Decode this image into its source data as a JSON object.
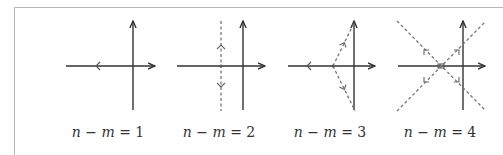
{
  "figure": {
    "panels": [
      {
        "id": "p1",
        "label": {
          "lhs_n": "n",
          "minus": " − ",
          "lhs_m": "m",
          "eq": " = ",
          "value": "1"
        },
        "origin": [
          133,
          66
        ],
        "centroid": [
          133,
          66
        ],
        "asymptote_count": 1,
        "asymptote_angles_deg": [
          180
        ],
        "asymptotes": "single asymptote along negative real axis"
      },
      {
        "id": "p2",
        "label": {
          "lhs_n": "n",
          "minus": " − ",
          "lhs_m": "m",
          "eq": " = ",
          "value": "2"
        },
        "origin": [
          243,
          66
        ],
        "centroid": [
          221,
          66
        ],
        "asymptote_count": 2,
        "asymptote_angles_deg": [
          90,
          270
        ],
        "asymptotes": "vertical dashed line through centroid"
      },
      {
        "id": "p3",
        "label": {
          "lhs_n": "n",
          "minus": " − ",
          "lhs_m": "m",
          "eq": " = ",
          "value": "3"
        },
        "origin": [
          354,
          66
        ],
        "centroid": [
          333,
          66
        ],
        "asymptote_count": 3,
        "asymptote_angles_deg": [
          60,
          180,
          300
        ],
        "asymptotes": "negative real axis plus two dashed lines at ±60°"
      },
      {
        "id": "p4",
        "label": {
          "lhs_n": "n",
          "minus": " − ",
          "lhs_m": "m",
          "eq": " = ",
          "value": "4"
        },
        "origin": [
          463,
          66
        ],
        "centroid": [
          441,
          66
        ],
        "asymptote_count": 4,
        "asymptote_angles_deg": [
          45,
          135,
          225,
          315
        ],
        "asymptotes": "two dashed diagonals crossing at centroid"
      }
    ],
    "colors": {
      "axis": "#333333",
      "asymptote": "#7a7a7a",
      "frame": "#b8b8b8"
    }
  }
}
